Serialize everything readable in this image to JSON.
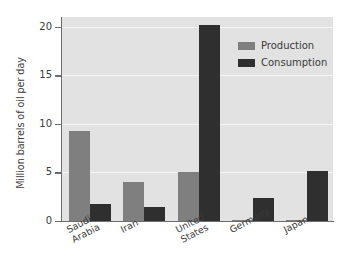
{
  "chart_data": {
    "type": "bar",
    "title": "",
    "subtitle": "",
    "xlabel": "",
    "ylabel": "Million barrels of oil per day",
    "categories": [
      "Saudi Arabia",
      "Iran",
      "United States",
      "Germany",
      "Japan"
    ],
    "category_lines": [
      [
        "Saudi",
        "Arabia"
      ],
      [
        "Iran"
      ],
      [
        "United",
        "States"
      ],
      [
        "Germany"
      ],
      [
        "Japan"
      ]
    ],
    "series": [
      {
        "name": "Production",
        "color": "#7f7f7f",
        "values": [
          9.3,
          4.0,
          5.0,
          0.1,
          0.05
        ]
      },
      {
        "name": "Consumption",
        "color": "#2f2f2f",
        "values": [
          1.8,
          1.4,
          20.2,
          2.4,
          5.1
        ]
      }
    ],
    "ylim": [
      0,
      21
    ],
    "yticks": [
      0,
      5,
      10,
      15,
      20
    ],
    "ytick_labels": [
      "0",
      "5",
      "10",
      "15",
      "20"
    ],
    "grid": true,
    "grid_color": "#f4f4f4",
    "legend_position": "upper right",
    "plot_background": "#e2e2e2",
    "figure_background": "#ffffff",
    "axis_color": "#6d6d6d"
  },
  "legend": {
    "entries": [
      {
        "label": "Production",
        "color": "#7f7f7f"
      },
      {
        "label": "Consumption",
        "color": "#2f2f2f"
      }
    ]
  }
}
